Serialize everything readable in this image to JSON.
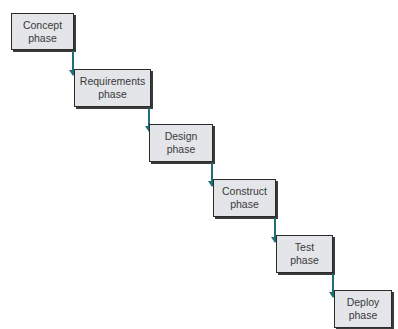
{
  "diagram": {
    "type": "waterfall",
    "arrow_color": "#1f6f78",
    "box_fill": "#e3e5e8",
    "phases": [
      {
        "line1": "Concept",
        "line2": "phase"
      },
      {
        "line1": "Requirements",
        "line2": "phase"
      },
      {
        "line1": "Design",
        "line2": "phase"
      },
      {
        "line1": "Construct",
        "line2": "phase"
      },
      {
        "line1": "Test",
        "line2": "phase"
      },
      {
        "line1": "Deploy",
        "line2": "phase"
      }
    ]
  }
}
